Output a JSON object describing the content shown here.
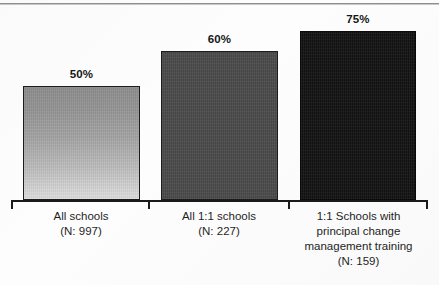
{
  "figure": {
    "background_color": "#fdfdfd",
    "top_rule_color": "#8f8f8f"
  },
  "chart_data": {
    "type": "bar",
    "title": "",
    "subtitle": "",
    "xlabel": "",
    "ylabel": "",
    "ylim": [
      0,
      100
    ],
    "grid": false,
    "legend": "none",
    "orientation": "vertical",
    "axis": {
      "baseline": true,
      "tick_marks": 4,
      "tick_labels": []
    },
    "categories": [
      "All schools (N: 997)",
      "All 1:1 schools (N: 227)",
      "1:1 Schools with principal change management training (N: 159)"
    ],
    "values": [
      50,
      60,
      75
    ],
    "value_labels": [
      "50%",
      "60%",
      "75%"
    ],
    "sample_sizes": [
      997,
      227,
      159
    ],
    "bar_colors": [
      "#a8a8a8",
      "#4a4a4a",
      "#121212"
    ],
    "bars": [
      {
        "value": 50,
        "value_label": "50%",
        "fill": "gradient-gray",
        "fill_top": "#8e8e8e",
        "fill_bottom": "#dedede",
        "label_lines": [
          "All schools",
          "(N: 997)"
        ]
      },
      {
        "value": 60,
        "value_label": "60%",
        "fill": "solid",
        "fill_top": "#4a4a4a",
        "fill_bottom": "#4a4a4a",
        "label_lines": [
          "All 1:1 schools",
          "(N: 227)"
        ]
      },
      {
        "value": 75,
        "value_label": "75%",
        "fill": "solid",
        "fill_top": "#121212",
        "fill_bottom": "#121212",
        "label_lines": [
          "1:1 Schools with",
          "principal change",
          "management training",
          "(N: 159)"
        ]
      }
    ]
  }
}
